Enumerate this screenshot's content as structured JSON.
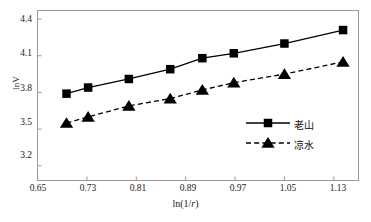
{
  "chart_data": {
    "type": "line",
    "title": "",
    "xlabel": "ln(1/r)",
    "ylabel": "lnV",
    "xlim": [
      0.65,
      1.17
    ],
    "ylim": [
      3.08,
      4.47
    ],
    "grid": false,
    "legend_position": "lower-right-inside",
    "xticks": [
      "0.65",
      "0.73",
      "0.81",
      "0.89",
      "0.97",
      "1.05",
      "1.13"
    ],
    "xtick_values": [
      0.65,
      0.73,
      0.81,
      0.89,
      0.97,
      1.05,
      1.13
    ],
    "yticks": [
      "3.2",
      "3.5",
      "3.8",
      "4.1",
      "4.4"
    ],
    "ytick_values": [
      3.2,
      3.5,
      3.8,
      4.1,
      4.4
    ],
    "series": [
      {
        "name": "老山",
        "marker": "square",
        "line_style": "solid",
        "color": "#000000",
        "x": [
          0.697,
          0.732,
          0.798,
          0.865,
          0.917,
          0.968,
          1.05,
          1.145
        ],
        "values": [
          3.79,
          3.84,
          3.91,
          3.99,
          4.08,
          4.12,
          4.2,
          4.31
        ]
      },
      {
        "name": "凉水",
        "marker": "triangle",
        "line_style": "dashed",
        "color": "#000000",
        "x": [
          0.697,
          0.732,
          0.798,
          0.865,
          0.917,
          0.968,
          1.05,
          1.145
        ],
        "values": [
          3.55,
          3.6,
          3.69,
          3.75,
          3.82,
          3.88,
          3.95,
          4.05
        ]
      }
    ]
  },
  "axes": {
    "x_title": "ln(1/",
    "x_title_italic": "r",
    "x_title_tail": ")",
    "y_title": "lnV"
  },
  "xticks": {
    "t0": "0.65",
    "t1": "0.73",
    "t2": "0.81",
    "t3": "0.89",
    "t4": "0.97",
    "t5": "1.05",
    "t6": "1.13"
  },
  "yticks": {
    "t0": "3.2",
    "t1": "3.5",
    "t2": "3.8",
    "t3": "4.1",
    "t4": "4.4"
  },
  "legend": {
    "entry0": "老山",
    "entry1": "凉水"
  }
}
